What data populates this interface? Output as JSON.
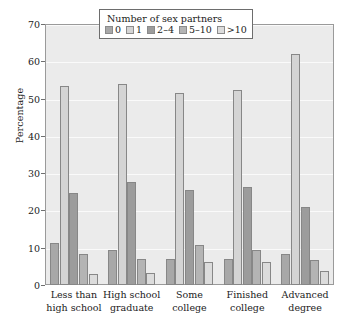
{
  "chart_data": {
    "type": "bar",
    "title": "",
    "xlabel": "",
    "ylabel": "Percentage",
    "ylim": [
      0,
      70
    ],
    "yticks": [
      0,
      10,
      20,
      30,
      40,
      50,
      60,
      70
    ],
    "ytick_labels": [
      "0",
      "10",
      "20",
      "30",
      "40",
      "50",
      "60",
      "70"
    ],
    "grid": true,
    "legend_position": "top-center",
    "legend_title": "Number of sex partners",
    "categories": [
      "Less than high school",
      "High school graduate",
      "Some college",
      "Finished college",
      "Advanced degree"
    ],
    "category_lines": [
      [
        "Less than",
        "high school"
      ],
      [
        "High school",
        "graduate"
      ],
      [
        "Some",
        "college"
      ],
      [
        "Finished",
        "college"
      ],
      [
        "Advanced",
        "degree"
      ]
    ],
    "series": [
      {
        "name": "0",
        "color": "#a8a8a8",
        "values": [
          11.3,
          9.3,
          6.9,
          7.0,
          8.2
        ]
      },
      {
        "name": "1",
        "color": "#d4d4d4",
        "values": [
          53.4,
          53.9,
          51.4,
          52.2,
          61.9
        ]
      },
      {
        "name": "2-4",
        "color": "#9c9c9c",
        "values": [
          24.6,
          27.5,
          25.6,
          26.4,
          20.8
        ]
      },
      {
        "name": "5-10",
        "color": "#b4b4b4",
        "values": [
          8.2,
          6.9,
          10.8,
          9.4,
          6.6
        ]
      },
      {
        "name": ">10",
        "color": "#dcdcdc",
        "values": [
          2.9,
          3.1,
          6.3,
          6.1,
          3.7
        ]
      }
    ],
    "legend_entries": [
      {
        "label": "0",
        "color": "#a8a8a8"
      },
      {
        "label": "1",
        "color": "#d4d4d4"
      },
      {
        "label": "2–4",
        "color": "#9c9c9c"
      },
      {
        "label": "5–10",
        "color": "#b4b4b4"
      },
      {
        "label": ">10",
        "color": "#dcdcdc"
      }
    ],
    "panel_background": "#ebebeb",
    "gridline_color": "#fafafa",
    "axis_color": "#6f6f6f",
    "text_color": "#1b1b1b"
  }
}
